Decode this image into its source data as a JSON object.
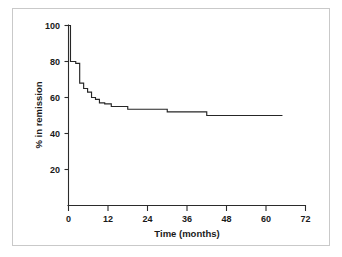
{
  "figure": {
    "background_color": "#ffffff",
    "frame_color": "#c9c9c9",
    "line_color": "#262626",
    "axis_color": "#2b2b2b"
  },
  "chart_data": {
    "type": "line",
    "subtype": "kaplan-meier-step",
    "title": "",
    "xlabel": "Time (months)",
    "ylabel": "% in remission",
    "xlim": [
      0,
      72
    ],
    "ylim": [
      0,
      100
    ],
    "xticks": [
      0,
      12,
      24,
      36,
      48,
      60,
      72
    ],
    "xticklabels": [
      "0",
      "12",
      "24",
      "36",
      "48",
      "60",
      "72"
    ],
    "yticks": [
      20,
      40,
      60,
      80,
      100
    ],
    "yticklabels": [
      "20",
      "40",
      "60",
      "80",
      "100"
    ],
    "grid": false,
    "legend": null,
    "series": [
      {
        "name": "% in remission",
        "x": [
          0,
          0.6,
          0.6,
          2.2,
          2.2,
          3.4,
          3.4,
          4.6,
          4.6,
          5.8,
          5.8,
          7.0,
          7.0,
          8.2,
          8.2,
          9.4,
          9.4,
          11.0,
          11.0,
          13.0,
          13.0,
          18.0,
          18.0,
          30.0,
          30.0,
          42.0,
          42.0,
          65.0
        ],
        "y": [
          100,
          100,
          80,
          80,
          79,
          79,
          68,
          68,
          65,
          65,
          63,
          63,
          60,
          60,
          59,
          59,
          57,
          57,
          56.5,
          56.5,
          55,
          55,
          53.5,
          53.5,
          52,
          52,
          50,
          50
        ]
      }
    ]
  }
}
